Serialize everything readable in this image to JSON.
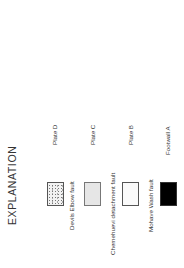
{
  "legend": {
    "title": "EXPLANATION",
    "orientation": "rotated-90-ccw",
    "units": [
      {
        "label": "Plate D",
        "pattern": "stippled",
        "fill_color": "#f2f2f2",
        "bounding_fault": "Devils Elbow fault"
      },
      {
        "label": "Plate C",
        "pattern": "light-gray",
        "fill_color": "#e6e6e6",
        "bounding_fault": "Chemehuevi detachment fault"
      },
      {
        "label": "Plate B",
        "pattern": "fine-dot-grid",
        "fill_color": "#fafafa",
        "bounding_fault": "Mohave Wash fault"
      },
      {
        "label": "Footwall A",
        "pattern": "solid-black",
        "fill_color": "#000000",
        "bounding_fault": ""
      }
    ]
  }
}
